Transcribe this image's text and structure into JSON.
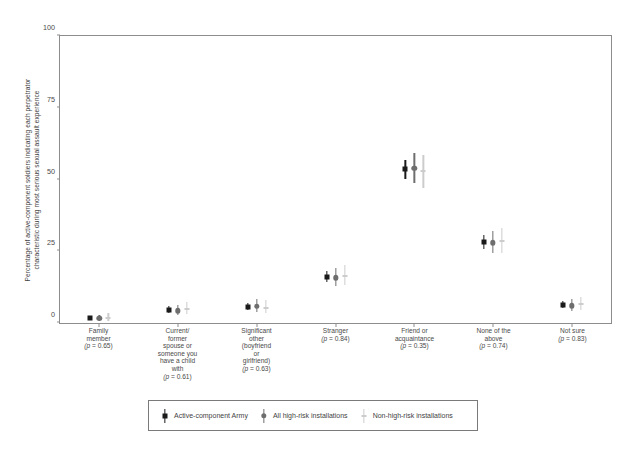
{
  "chart_data": {
    "type": "scatter",
    "title": "",
    "xlabel": "",
    "ylabel_line1": "Percentage of active-component soldiers indicating each perpetrator",
    "ylabel_line2": "characteristic during most serious sexual assault experience",
    "ylim": [
      0,
      100
    ],
    "yticks": [
      0,
      25,
      50,
      75,
      100
    ],
    "ytick_labels": [
      "0",
      "25",
      "50",
      "75",
      "100"
    ],
    "grid": false,
    "legend_position": "bottom",
    "categories": [
      "Family member",
      "Current/ former spouse or someone you have a child with",
      "Significant other (boyfriend or girlfriend)",
      "Stranger",
      "Friend or acquaintance",
      "None of the above",
      "Not sure"
    ],
    "category_label_lines": [
      [
        "Family",
        "member"
      ],
      [
        "Current/",
        "former",
        "spouse or",
        "someone you",
        "have a child",
        "with"
      ],
      [
        "Significant",
        "other",
        "(boyfriend",
        "or",
        "girlfriend)"
      ],
      [
        "Stranger"
      ],
      [
        "Friend or",
        "acquaintance"
      ],
      [
        "None of the",
        "above"
      ],
      [
        "Not sure"
      ]
    ],
    "p_values": [
      "0.65",
      "0.61",
      "0.63",
      "0.84",
      "0.35",
      "0.74",
      "0.83"
    ],
    "p_prefix": "p = ",
    "series": [
      {
        "name": "Active-component Army",
        "marker": "square",
        "color": "#1a1a1a",
        "values": [
          1.8,
          4.6,
          5.6,
          16.2,
          53.5,
          28.2,
          6.3
        ],
        "ci_low": [
          1.3,
          3.6,
          4.5,
          14.4,
          50.2,
          25.8,
          5.2
        ],
        "ci_high": [
          2.5,
          5.8,
          6.9,
          18.2,
          56.8,
          30.8,
          7.6
        ]
      },
      {
        "name": "All high-risk installations",
        "marker": "circle",
        "color": "#6e6e6e",
        "values": [
          1.6,
          4.3,
          5.8,
          15.8,
          54.0,
          28.0,
          6.0
        ],
        "ci_low": [
          0.7,
          2.8,
          3.9,
          12.9,
          48.8,
          24.3,
          4.3
        ],
        "ci_high": [
          2.8,
          6.3,
          8.2,
          19.1,
          59.1,
          32.1,
          8.2
        ]
      },
      {
        "name": "Non-high-risk installations",
        "marker": "dash",
        "color": "#cccccc",
        "values": [
          1.9,
          4.9,
          5.4,
          16.5,
          52.9,
          28.5,
          6.6
        ],
        "ci_low": [
          0.8,
          3.1,
          3.4,
          13.2,
          47.2,
          24.4,
          4.6
        ],
        "ci_high": [
          3.4,
          7.2,
          8.0,
          20.3,
          58.5,
          33.1,
          9.2
        ]
      }
    ]
  },
  "legend": {
    "items": [
      {
        "label": "Active-component Army",
        "color": "#1a1a1a",
        "marker": "square"
      },
      {
        "label": "All high-risk installations",
        "color": "#6e6e6e",
        "marker": "circle"
      },
      {
        "label": "Non-high-risk installations",
        "color": "#cccccc",
        "marker": "dash"
      }
    ]
  },
  "colors": {
    "axis": "#8d8d8d",
    "text": "#4a4a4a",
    "background": "#ffffff"
  }
}
